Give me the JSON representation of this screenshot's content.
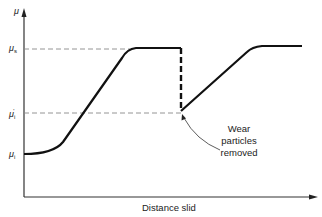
{
  "diagram": {
    "y_axis_label": "μ",
    "x_axis_label": "Distance slid",
    "levels": [
      {
        "id": "mu_s",
        "symbol": "μ",
        "subscript": "s",
        "superscript": ""
      },
      {
        "id": "mu_i_prime",
        "symbol": "μ",
        "subscript": "i",
        "superscript": "'"
      },
      {
        "id": "mu_i",
        "symbol": "μ",
        "subscript": "i",
        "superscript": ""
      }
    ],
    "annotation": {
      "line1": "Wear",
      "line2": "particles",
      "line3": "removed"
    },
    "colors": {
      "curve": "#111111",
      "dashed": "#888888",
      "axis": "#333333"
    }
  }
}
